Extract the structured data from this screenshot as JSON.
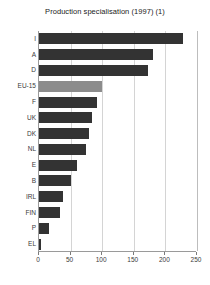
{
  "chart_data": {
    "type": "bar",
    "orientation": "horizontal",
    "title": "Production specialisation (1997) (1)",
    "xlabel": "",
    "ylabel": "",
    "categories": [
      "I",
      "A",
      "D",
      "EU-15",
      "F",
      "UK",
      "DK",
      "NL",
      "E",
      "B",
      "IRL",
      "FIN",
      "P",
      "EL"
    ],
    "values": [
      228,
      180,
      172,
      100,
      92,
      84,
      79,
      74,
      60,
      50,
      38,
      33,
      16,
      3
    ],
    "highlight_category": "EU-15",
    "xlim": [
      0,
      250
    ],
    "xticks": [
      0,
      50,
      100,
      150,
      200,
      250
    ],
    "xtick_labels": [
      "0",
      "50",
      "100",
      "150",
      "200",
      "250"
    ],
    "grid": true,
    "grid_axis": "x",
    "legend": false,
    "bar_color": "#333333",
    "highlight_color": "#8c8c8c",
    "gridline_color": "#d4d4d4",
    "axis_color": "#9a9a9a",
    "background_color": "#ffffff",
    "text_color": "#3a3a3a"
  }
}
